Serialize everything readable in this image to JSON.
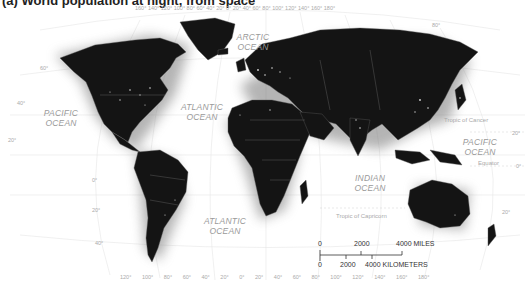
{
  "title": "(a) World population at night, from space",
  "oceans": [
    {
      "id": "pacific-west",
      "line1": "PACIFIC",
      "line2": "OCEAN"
    },
    {
      "id": "arctic",
      "line1": "ARCTIC",
      "line2": "OCEAN"
    },
    {
      "id": "atlantic-north",
      "line1": "ATLANTIC",
      "line2": "OCEAN"
    },
    {
      "id": "atlantic-south",
      "line1": "ATLANTIC",
      "line2": "OCEAN"
    },
    {
      "id": "indian",
      "line1": "INDIAN",
      "line2": "OCEAN"
    },
    {
      "id": "pacific-east",
      "line1": "PACIFIC",
      "line2": "OCEAN"
    }
  ],
  "reference_lines": {
    "tropic_cancer": "Tropic of Cancer",
    "equator": "Equator",
    "tropic_capricorn": "Tropic of Capricorn"
  },
  "longitude_top": "160° 140° 120° 100° 80°  60° 40°  20°  0°  20°  40°  60°  80° 100° 120° 140° 160° 180°",
  "longitude_bottom": "120°  100°  80°  60°  40°  20°  0°  20°  40°  60°  80°  100°  120°  140°  160°  180°",
  "latitudes": {
    "lat80": "80°",
    "lat60": "60°",
    "lat40n": "40°",
    "lat20n": "20°",
    "lat0": "0°",
    "lat20s": "20°",
    "lat40s": "40°",
    "lat20e": "20°",
    "lat0e": "0°",
    "lat20se": "20°"
  },
  "scale_bar": {
    "miles_zero": "0",
    "miles_mid": "2000",
    "miles_end": "4000 MILES",
    "km_zero": "0",
    "km_mid": "2000",
    "km_end": "4000 KILOMETERS"
  }
}
